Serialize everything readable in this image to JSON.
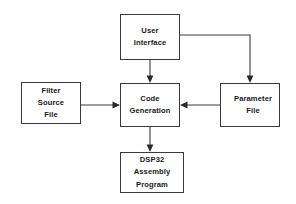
{
  "diagram": {
    "background_color": "#ffffff",
    "stroke_color": "#3a3a3a",
    "text_color": "#1a1a1a",
    "nodes": [
      {
        "id": "user-interface",
        "lines": [
          "User",
          "Interface"
        ],
        "line1": "User",
        "line2": "Interface"
      },
      {
        "id": "filter-source-file",
        "lines": [
          "Filter",
          "Source",
          "File"
        ],
        "line1": "Filter",
        "line2": "Source",
        "line3": "File"
      },
      {
        "id": "code-generation",
        "lines": [
          "Code",
          "Generation"
        ],
        "line1": "Code",
        "line2": "Generation"
      },
      {
        "id": "parameter-file",
        "lines": [
          "Parameter",
          "File"
        ],
        "line1": "Parameter",
        "line2": "File"
      },
      {
        "id": "dsp32-assembly-program",
        "lines": [
          "DSP32",
          "Assembly",
          "Program"
        ],
        "line1": "DSP32",
        "line2": "Assembly",
        "line3": "Program"
      }
    ],
    "edges": [
      {
        "id": "ui-to-code-generation",
        "from": "user-interface",
        "to": "code-generation",
        "arrow": "down",
        "routing": "straight-vertical"
      },
      {
        "id": "ui-to-parameter-file",
        "from": "user-interface",
        "to": "parameter-file",
        "arrow": "down",
        "routing": "orthogonal-right-then-down"
      },
      {
        "id": "filter-to-code-generation",
        "from": "filter-source-file",
        "to": "code-generation",
        "arrow": "right",
        "routing": "straight-horizontal"
      },
      {
        "id": "parameter-to-code-generation",
        "from": "parameter-file",
        "to": "code-generation",
        "arrow": "left",
        "routing": "straight-horizontal"
      },
      {
        "id": "code-generation-to-dsp32",
        "from": "code-generation",
        "to": "dsp32-assembly-program",
        "arrow": "down",
        "routing": "straight-vertical"
      }
    ]
  }
}
